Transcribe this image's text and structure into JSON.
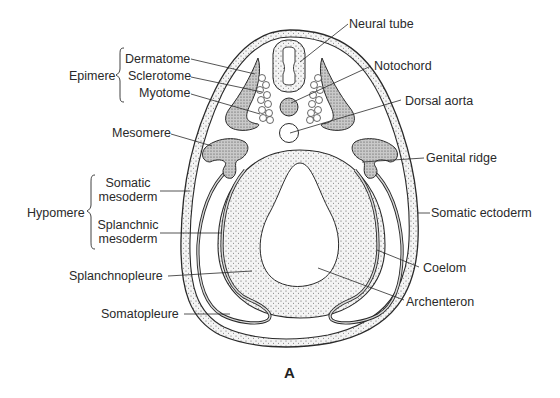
{
  "figure": {
    "caption": "A"
  },
  "labels": {
    "neural_tube": "Neural tube",
    "notochord": "Notochord",
    "dorsal_aorta": "Dorsal aorta",
    "genital_ridge": "Genital ridge",
    "somatic_ectoderm": "Somatic ectoderm",
    "coelom": "Coelom",
    "archenteron": "Archenteron",
    "epimere": "Epimere",
    "dermatome": "Dermatome",
    "sclerotome": "Sclerotome",
    "myotome": "Myotome",
    "mesomere": "Mesomere",
    "hypomere": "Hypomere",
    "somatic_mesoderm_1": "Somatic",
    "somatic_mesoderm_2": "mesoderm",
    "splanchnic_mesoderm_1": "Splanchnic",
    "splanchnic_mesoderm_2": "mesoderm",
    "splanchnopleure": "Splanchnopleure",
    "somatopleure": "Somatopleure"
  },
  "colors": {
    "ink": "#2a2a2a",
    "stipple_fill": "#e6e6e6",
    "dark_fill": "#bdbdbd",
    "background": "#ffffff"
  }
}
